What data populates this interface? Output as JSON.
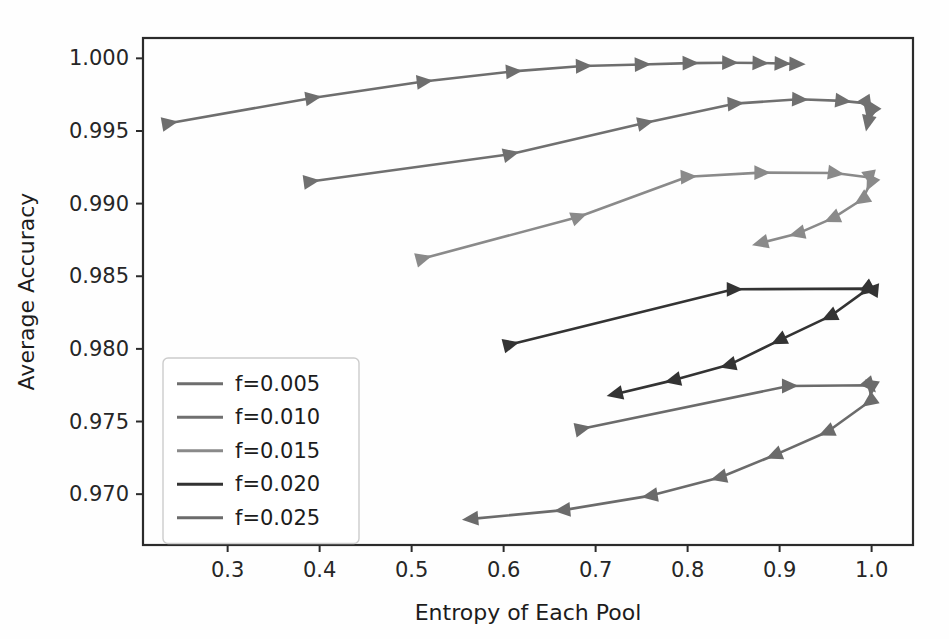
{
  "chart_data": {
    "type": "line",
    "title": "",
    "xlabel": "Entropy of Each Pool",
    "ylabel": "Average Accuracy",
    "xlim": [
      0.208,
      1.045
    ],
    "ylim": [
      0.9665,
      1.0014
    ],
    "xticks": [
      0.3,
      0.4,
      0.5,
      0.6,
      0.7,
      0.8,
      0.9,
      1.0
    ],
    "xtick_labels": [
      "0.3",
      "0.4",
      "0.5",
      "0.6",
      "0.7",
      "0.8",
      "0.9",
      "1.0"
    ],
    "yticks": [
      0.97,
      0.975,
      0.98,
      0.985,
      0.99,
      0.995,
      1.0
    ],
    "ytick_labels": [
      "0.970",
      "0.975",
      "0.980",
      "0.985",
      "0.990",
      "0.995",
      "1.000"
    ],
    "grid": false,
    "marker": "triangle-directional",
    "legend_position": "lower-left",
    "series": [
      {
        "name": "f=0.005",
        "color": "#6e6e6e",
        "points": [
          [
            0.236,
            0.99553
          ],
          [
            0.392,
            0.99727
          ],
          [
            0.513,
            0.9984
          ],
          [
            0.61,
            0.9991
          ],
          [
            0.686,
            0.99947
          ],
          [
            0.75,
            0.99958
          ],
          [
            0.802,
            0.99967
          ],
          [
            0.845,
            0.9997
          ],
          [
            0.878,
            0.99968
          ],
          [
            0.902,
            0.99964
          ],
          [
            0.918,
            0.99961
          ]
        ]
      },
      {
        "name": "f=0.010",
        "color": "#707070",
        "points": [
          [
            0.39,
            0.99152
          ],
          [
            0.607,
            0.9934
          ],
          [
            0.753,
            0.99555
          ],
          [
            0.851,
            0.99688
          ],
          [
            0.921,
            0.99718
          ],
          [
            0.968,
            0.99707
          ],
          [
            0.995,
            0.9969
          ],
          [
            1.0,
            0.9964
          ],
          [
            0.998,
            0.9962
          ],
          [
            0.996,
            0.9956
          ]
        ]
      },
      {
        "name": "f=0.015",
        "color": "#8a8a8a",
        "points": [
          [
            0.512,
            0.98622
          ],
          [
            0.681,
            0.98908
          ],
          [
            0.8,
            0.99185
          ],
          [
            0.88,
            0.99213
          ],
          [
            0.96,
            0.99211
          ],
          [
            0.998,
            0.9918
          ],
          [
            0.999,
            0.99145
          ],
          [
            0.99,
            0.9903
          ],
          [
            0.958,
            0.989
          ],
          [
            0.92,
            0.98795
          ],
          [
            0.88,
            0.9873
          ]
        ]
      },
      {
        "name": "f=0.020",
        "color": "#333333",
        "points": [
          [
            0.607,
            0.9803
          ],
          [
            0.85,
            0.9841
          ],
          [
            0.998,
            0.98415
          ],
          [
            1.0,
            0.98405
          ],
          [
            0.995,
            0.98408
          ],
          [
            0.955,
            0.98225
          ],
          [
            0.9,
            0.9806
          ],
          [
            0.845,
            0.9789
          ],
          [
            0.785,
            0.97785
          ],
          [
            0.722,
            0.9769
          ]
        ]
      },
      {
        "name": "f=0.025",
        "color": "#6b6b6b",
        "points": [
          [
            0.685,
            0.9745
          ],
          [
            0.91,
            0.97745
          ],
          [
            0.998,
            0.9775
          ],
          [
            1.0,
            0.97735
          ],
          [
            0.998,
            0.9764
          ],
          [
            0.952,
            0.9743
          ],
          [
            0.895,
            0.9727
          ],
          [
            0.835,
            0.97115
          ],
          [
            0.76,
            0.9699
          ],
          [
            0.665,
            0.9689
          ],
          [
            0.565,
            0.9683
          ]
        ]
      }
    ]
  }
}
